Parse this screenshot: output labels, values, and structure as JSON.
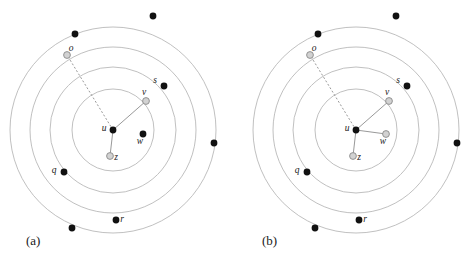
{
  "figure": {
    "width": 472,
    "height": 261,
    "background": "#ffffff",
    "ring_color": "#b9b9b9",
    "edge_color": "#8d8d8d",
    "node_black_color": "#111111",
    "node_gray_fill": "#d2d2d2",
    "node_gray_stroke": "#8a8a8a",
    "label_color": "#1a1a1a"
  },
  "panels": [
    {
      "id": "a",
      "caption": "(a)",
      "center": {
        "x": 113,
        "y": 130
      },
      "rings": [
        {
          "name": "ring-1",
          "radius": 41
        },
        {
          "name": "ring-2",
          "radius": 63
        },
        {
          "name": "ring-3",
          "radius": 83
        },
        {
          "name": "ring-4",
          "radius": 103
        }
      ],
      "edges": [
        {
          "from": "u",
          "to": "o",
          "style": "dashed"
        },
        {
          "from": "u",
          "to": "v",
          "style": "solid"
        },
        {
          "from": "u",
          "to": "z",
          "style": "solid"
        }
      ],
      "nodes": [
        {
          "id": "u",
          "label": "u",
          "x": 113,
          "y": 130,
          "type": "black",
          "r": 3.4,
          "label_dx": -9,
          "label_dy": 1
        },
        {
          "id": "o",
          "label": "o",
          "x": 67,
          "y": 55,
          "type": "gray",
          "r": 3.4,
          "label_dx": 4,
          "label_dy": -4
        },
        {
          "id": "v",
          "label": "v",
          "x": 146,
          "y": 101,
          "type": "gray",
          "r": 3.4,
          "label_dx": -2,
          "label_dy": -6
        },
        {
          "id": "z",
          "label": "z",
          "x": 110,
          "y": 156,
          "type": "gray",
          "r": 3.4,
          "label_dx": 6,
          "label_dy": 4
        },
        {
          "id": "w",
          "label": "w",
          "x": 143,
          "y": 134,
          "type": "black",
          "r": 3.4,
          "label_dx": -3,
          "label_dy": 10
        },
        {
          "id": "s",
          "label": "s",
          "x": 164,
          "y": 86,
          "type": "black",
          "r": 3.4,
          "label_dx": -9,
          "label_dy": -3
        },
        {
          "id": "q",
          "label": "q",
          "x": 64,
          "y": 172,
          "type": "black",
          "r": 3.4,
          "label_dx": -10,
          "label_dy": 1
        },
        {
          "id": "r",
          "label": "r",
          "x": 116,
          "y": 220,
          "type": "black",
          "r": 3.4,
          "label_dx": 6,
          "label_dy": 2
        }
      ],
      "outer_dots": [
        {
          "name": "outer-dot-top",
          "x": 153,
          "y": 16,
          "r": 3.4
        },
        {
          "name": "outer-dot-upper-left",
          "x": 75,
          "y": 34,
          "r": 3.4
        },
        {
          "name": "outer-dot-right",
          "x": 214,
          "y": 143,
          "r": 3.4
        },
        {
          "name": "outer-dot-bottom-left",
          "x": 72,
          "y": 228,
          "r": 3.4
        }
      ]
    },
    {
      "id": "b",
      "caption": "(b)",
      "center": {
        "x": 356,
        "y": 130
      },
      "rings": [
        {
          "name": "ring-1",
          "radius": 41
        },
        {
          "name": "ring-2",
          "radius": 63
        },
        {
          "name": "ring-3",
          "radius": 83
        },
        {
          "name": "ring-4",
          "radius": 103
        }
      ],
      "edges": [
        {
          "from": "u",
          "to": "o",
          "style": "dashed"
        },
        {
          "from": "u",
          "to": "v",
          "style": "solid"
        },
        {
          "from": "u",
          "to": "z",
          "style": "solid"
        },
        {
          "from": "u",
          "to": "w",
          "style": "solid"
        }
      ],
      "nodes": [
        {
          "id": "u",
          "label": "u",
          "x": 356,
          "y": 130,
          "type": "black",
          "r": 3.4,
          "label_dx": -9,
          "label_dy": 1
        },
        {
          "id": "o",
          "label": "o",
          "x": 310,
          "y": 55,
          "type": "gray",
          "r": 3.4,
          "label_dx": 4,
          "label_dy": -4
        },
        {
          "id": "v",
          "label": "v",
          "x": 389,
          "y": 101,
          "type": "gray",
          "r": 3.4,
          "label_dx": -2,
          "label_dy": -6
        },
        {
          "id": "z",
          "label": "z",
          "x": 353,
          "y": 156,
          "type": "gray",
          "r": 3.4,
          "label_dx": 6,
          "label_dy": 4
        },
        {
          "id": "w",
          "label": "w",
          "x": 386,
          "y": 134,
          "type": "gray",
          "r": 3.4,
          "label_dx": -3,
          "label_dy": 10
        },
        {
          "id": "s",
          "label": "s",
          "x": 407,
          "y": 86,
          "type": "black",
          "r": 3.4,
          "label_dx": -9,
          "label_dy": -3
        },
        {
          "id": "q",
          "label": "q",
          "x": 307,
          "y": 172,
          "type": "black",
          "r": 3.4,
          "label_dx": -10,
          "label_dy": 1
        },
        {
          "id": "r",
          "label": "r",
          "x": 359,
          "y": 220,
          "type": "black",
          "r": 3.4,
          "label_dx": 6,
          "label_dy": 2
        }
      ],
      "outer_dots": [
        {
          "name": "outer-dot-top",
          "x": 396,
          "y": 16,
          "r": 3.4
        },
        {
          "name": "outer-dot-upper-left",
          "x": 318,
          "y": 34,
          "r": 3.4
        },
        {
          "name": "outer-dot-right",
          "x": 457,
          "y": 143,
          "r": 3.4
        },
        {
          "name": "outer-dot-bottom-left",
          "x": 315,
          "y": 228,
          "r": 3.4
        }
      ]
    }
  ]
}
